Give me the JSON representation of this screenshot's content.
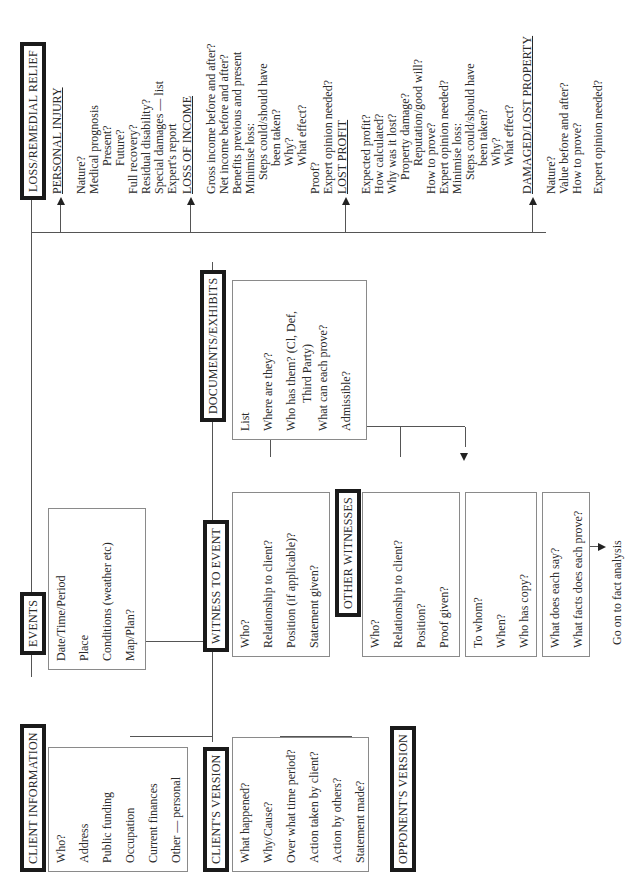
{
  "orientation": "rotated-90-ccw",
  "nodes": {
    "client_information": {
      "title": "CLIENT INFORMATION",
      "items": [
        "Who?",
        "Address",
        "Public funding",
        "Occupation",
        "Current finances",
        "Other — personal"
      ]
    },
    "events": {
      "title": "EVENTS",
      "items": [
        "Date/Time/Period",
        "Place",
        "Conditions (weather etc)",
        "Map/Plan?"
      ]
    },
    "documents_exhibits": {
      "title": "DOCUMENTS/EXHIBITS",
      "items": [
        "List",
        "Where are they?",
        "Who has them? (Cl, Def,",
        "Third Party)",
        "What can each prove?",
        "Admissible?"
      ]
    },
    "clients_version": {
      "title": "CLIENT'S VERSION",
      "items": [
        "What happened?",
        "Why/Cause?",
        "Over what time period?",
        "Action taken by client?",
        "Action by others?",
        "Statement made?"
      ]
    },
    "opponents_version": {
      "title": "OPPONENT'S VERSION"
    },
    "witness_to_event": {
      "title": "WITNESS TO EVENT",
      "items": [
        "Who?",
        "Relationship to client?",
        "Position (if applicable)?",
        "Statement given?"
      ]
    },
    "other_witnesses": {
      "title": "OTHER WITNESSES",
      "items": [
        "Who?",
        "Relationship to client?",
        "Position?",
        "Proof given?"
      ]
    },
    "statement_box": {
      "items": [
        "To whom?",
        "When?",
        "Who has copy?"
      ]
    },
    "proof_box": {
      "items": [
        "What does each say?",
        "What facts does each prove?"
      ]
    },
    "next_step": "Go on to fact analysis",
    "loss_remedial_relief": {
      "title": "LOSS/REMEDIAL RELIEF",
      "sections": {
        "personal_injury": {
          "heading": "PERSONAL INJURY",
          "lines": [
            "Nature?",
            "Medical prognosis",
            "Present?",
            "Future?",
            "Full recovery?",
            "Residual disability?",
            "Special damages — list",
            "Expert's report"
          ]
        },
        "loss_of_income": {
          "heading": "LOSS OF INCOME",
          "lines": [
            "Gross income before and after?",
            "Net income before and after?",
            "Benefits previous and present",
            "Minimise loss:",
            "Steps could/should have",
            "been taken?",
            "Why?",
            "What effect?",
            "Proof?",
            "Expert opinion needed?"
          ]
        },
        "lost_profit": {
          "heading": "LOST PROFIT",
          "lines": [
            "Expected profit?",
            "How calculated?",
            "Why was it lost?",
            "Property damage?",
            "Reputation/good will?",
            "How to prove?",
            "Expert opinion needed?",
            "Minimise loss:",
            "Steps could/should have",
            "been taken?",
            "Why?",
            "What effect?"
          ]
        },
        "damaged_lost_property": {
          "heading": "DAMAGED/LOST PROPERTY",
          "lines": [
            "Nature?",
            "Value before and after?",
            "How to prove?",
            "Expert opinion needed?"
          ]
        }
      }
    }
  }
}
